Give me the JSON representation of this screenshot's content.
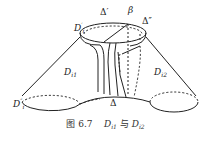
{
  "figure": {
    "labels": {
      "d_prime": {
        "base": "D",
        "sup": "′",
        "sub": "i"
      },
      "d_double_prime": {
        "base": "D",
        "sup": "″",
        "sub": "i"
      },
      "delta_prime": "Δ′",
      "delta_double_prime": "Δ″",
      "beta": "β",
      "delta": "Δ",
      "d_i1": {
        "base": "D",
        "sub": "i1"
      },
      "d_i2": {
        "base": "D",
        "sub": "i2"
      }
    },
    "caption": {
      "prefix": "图 6.7",
      "term1": {
        "base": "D",
        "sub": "i1"
      },
      "conj": "与",
      "term2": {
        "base": "D",
        "sub": "i2"
      }
    }
  }
}
